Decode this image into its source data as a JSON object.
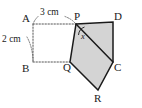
{
  "figure": {
    "canvas": {
      "width": 142,
      "height": 108
    },
    "colors": {
      "stroke": "#1a1a1a",
      "pentagon_fill": "#d4d4d4",
      "dotted": "#555555",
      "background": "#ffffff",
      "text": "#1a1a1a"
    },
    "vertex_labels": {
      "A": "A",
      "B": "B",
      "P": "P",
      "D": "D",
      "C": "C",
      "Q": "Q",
      "R": "R"
    },
    "dimension_labels": {
      "top": "3 cm",
      "left": "2 cm"
    },
    "angle_labels": {
      "at_P": "x"
    },
    "points": {
      "A": {
        "x": 33,
        "y": 24
      },
      "B": {
        "x": 33,
        "y": 62
      },
      "P": {
        "x": 76,
        "y": 24
      },
      "D": {
        "x": 113,
        "y": 22
      },
      "C": {
        "x": 113,
        "y": 62
      },
      "Q": {
        "x": 70,
        "y": 62
      },
      "R": {
        "x": 98,
        "y": 90
      }
    },
    "pentagon_path": "M 76 24 L 113 22 L 113 62 L 98 90 L 70 62 Z",
    "diagonal_PC": {
      "from": "P",
      "to": "C"
    },
    "dotted_segments": [
      {
        "name": "A-to-P",
        "x1": 33,
        "y1": 24,
        "x2": 76,
        "y2": 24
      },
      {
        "name": "A-to-B",
        "x1": 33,
        "y1": 24,
        "x2": 33,
        "y2": 62
      },
      {
        "name": "B-to-C",
        "x1": 33,
        "y1": 62,
        "x2": 113,
        "y2": 62
      }
    ],
    "leader_arcs": [
      {
        "name": "arc-3cm-left",
        "d": "M 37 17 Q 34 21 33.5 23.5"
      },
      {
        "name": "arc-3cm-right",
        "d": "M 66 17 Q 72 20 75.5 23.5"
      },
      {
        "name": "arc-2cm",
        "d": "M 28 38 Q 33 48 33 60"
      }
    ],
    "angle_arc_path": "M 79 35 Q 79.5 29.5 84 27"
  }
}
